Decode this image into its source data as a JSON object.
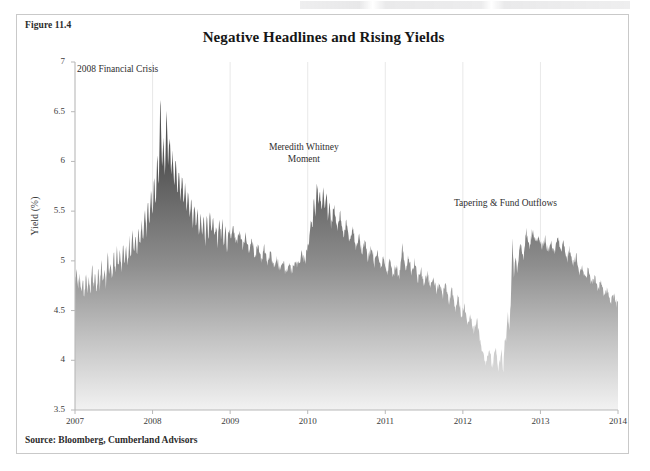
{
  "figure": {
    "label": "Figure 11.4",
    "title": "Negative Headlines and Rising Yields",
    "source": "Source: Bloomberg, Cumberland Advisors"
  },
  "colors": {
    "series_top": "#4a4a4a",
    "series_bottom": "#f2f2f2",
    "axis": "#b8b8b8",
    "gridline": "#e2e2e2",
    "text": "#2e2e2e",
    "border": "#c9c9c9"
  },
  "annotations": [
    {
      "id": "crisis-2008",
      "text": "2008 Financial Crisis",
      "x_value": 2007.55,
      "y_value": 6.93
    },
    {
      "id": "meredith-whitney",
      "text": "Meredith Whitney\nMoment",
      "x_value": 2009.95,
      "y_value": 6.15
    },
    {
      "id": "tapering",
      "text": "Tapering & Fund Outflows",
      "x_value": 2012.55,
      "y_value": 5.58
    }
  ],
  "chart_data": {
    "type": "area",
    "title": "Negative Headlines and Rising Yields",
    "xlabel": "",
    "ylabel": "Yield (%)",
    "xlim": [
      2007,
      2014
    ],
    "ylim": [
      3.5,
      7
    ],
    "x_ticks": [
      "2007",
      "2008",
      "2009",
      "2010",
      "2011",
      "2012",
      "2013",
      "2014"
    ],
    "y_ticks": [
      "3.5",
      "4",
      "4.5",
      "5",
      "5.5",
      "6",
      "6.5",
      "7"
    ],
    "grid": "vertical-faint",
    "legend": "none",
    "series_name": "Yield (%)",
    "fill": "gradient dark-to-light, top to baseline",
    "x": [
      2007.0,
      2007.02,
      2007.04,
      2007.06,
      2007.08,
      2007.1,
      2007.12,
      2007.14,
      2007.16,
      2007.18,
      2007.2,
      2007.22,
      2007.24,
      2007.26,
      2007.28,
      2007.3,
      2007.32,
      2007.34,
      2007.36,
      2007.38,
      2007.4,
      2007.42,
      2007.44,
      2007.46,
      2007.48,
      2007.5,
      2007.52,
      2007.54,
      2007.56,
      2007.58,
      2007.6,
      2007.62,
      2007.64,
      2007.66,
      2007.68,
      2007.7,
      2007.72,
      2007.74,
      2007.76,
      2007.78,
      2007.8,
      2007.82,
      2007.84,
      2007.86,
      2007.88,
      2007.9,
      2007.92,
      2007.94,
      2007.96,
      2007.98,
      2008.0,
      2008.02,
      2008.04,
      2008.06,
      2008.08,
      2008.1,
      2008.12,
      2008.14,
      2008.16,
      2008.18,
      2008.2,
      2008.22,
      2008.24,
      2008.26,
      2008.28,
      2008.3,
      2008.32,
      2008.34,
      2008.36,
      2008.38,
      2008.4,
      2008.42,
      2008.44,
      2008.46,
      2008.48,
      2008.5,
      2008.52,
      2008.54,
      2008.56,
      2008.58,
      2008.6,
      2008.62,
      2008.64,
      2008.66,
      2008.68,
      2008.7,
      2008.72,
      2008.74,
      2008.76,
      2008.78,
      2008.8,
      2008.82,
      2008.84,
      2008.86,
      2008.88,
      2008.9,
      2008.92,
      2008.94,
      2008.96,
      2008.98,
      2009.0,
      2009.04,
      2009.08,
      2009.12,
      2009.16,
      2009.2,
      2009.24,
      2009.28,
      2009.32,
      2009.36,
      2009.4,
      2009.44,
      2009.48,
      2009.52,
      2009.56,
      2009.6,
      2009.64,
      2009.68,
      2009.72,
      2009.76,
      2009.8,
      2009.84,
      2009.88,
      2009.92,
      2009.96,
      2010.0,
      2010.02,
      2010.04,
      2010.06,
      2010.08,
      2010.1,
      2010.12,
      2010.14,
      2010.16,
      2010.18,
      2010.2,
      2010.22,
      2010.24,
      2010.26,
      2010.28,
      2010.3,
      2010.34,
      2010.38,
      2010.42,
      2010.46,
      2010.5,
      2010.54,
      2010.58,
      2010.62,
      2010.66,
      2010.7,
      2010.74,
      2010.78,
      2010.82,
      2010.86,
      2010.9,
      2010.94,
      2010.98,
      2011.02,
      2011.06,
      2011.1,
      2011.14,
      2011.18,
      2011.22,
      2011.26,
      2011.3,
      2011.34,
      2011.38,
      2011.42,
      2011.46,
      2011.5,
      2011.54,
      2011.58,
      2011.62,
      2011.66,
      2011.7,
      2011.74,
      2011.78,
      2011.82,
      2011.86,
      2011.9,
      2011.94,
      2011.98,
      2012.02,
      2012.06,
      2012.1,
      2012.14,
      2012.18,
      2012.22,
      2012.26,
      2012.3,
      2012.34,
      2012.38,
      2012.42,
      2012.46,
      2012.5,
      2012.52,
      2012.54,
      2012.56,
      2012.58,
      2012.6,
      2012.62,
      2012.64,
      2012.66,
      2012.68,
      2012.7,
      2012.74,
      2012.78,
      2012.82,
      2012.86,
      2012.9,
      2012.94,
      2012.98,
      2013.02,
      2013.06,
      2013.1,
      2013.14,
      2013.18,
      2013.22,
      2013.26,
      2013.3,
      2013.34,
      2013.38,
      2013.42,
      2013.46,
      2013.5,
      2013.54,
      2013.58,
      2013.62,
      2013.66,
      2013.7,
      2013.74,
      2013.78,
      2013.82,
      2013.86,
      2013.9,
      2013.94,
      2013.98,
      2014.0
    ],
    "y": [
      4.76,
      4.92,
      4.7,
      4.86,
      4.66,
      4.82,
      4.62,
      4.9,
      4.68,
      4.84,
      4.64,
      4.96,
      4.72,
      4.88,
      4.66,
      4.94,
      4.7,
      5.02,
      4.78,
      4.92,
      4.72,
      5.1,
      4.84,
      5.0,
      4.8,
      5.06,
      4.86,
      5.14,
      4.9,
      5.08,
      4.88,
      5.18,
      4.96,
      5.12,
      4.92,
      5.22,
      5.02,
      5.3,
      5.08,
      5.26,
      5.04,
      5.34,
      5.12,
      5.42,
      5.2,
      5.5,
      5.26,
      5.64,
      5.34,
      5.72,
      5.4,
      5.86,
      5.52,
      6.1,
      5.7,
      6.72,
      5.9,
      6.2,
      5.84,
      6.55,
      5.96,
      6.24,
      5.88,
      6.08,
      5.76,
      6.0,
      5.68,
      5.92,
      5.6,
      5.86,
      5.54,
      5.78,
      5.46,
      5.7,
      5.4,
      5.62,
      5.34,
      5.58,
      5.28,
      5.52,
      5.24,
      5.48,
      5.2,
      5.44,
      5.18,
      5.46,
      5.22,
      5.5,
      5.26,
      5.42,
      5.2,
      5.38,
      5.16,
      5.44,
      5.22,
      5.4,
      5.14,
      5.32,
      5.1,
      5.28,
      5.22,
      5.34,
      5.16,
      5.3,
      5.12,
      5.26,
      5.08,
      5.2,
      5.04,
      5.16,
      5.0,
      5.12,
      4.96,
      5.06,
      4.92,
      5.02,
      4.88,
      4.98,
      4.86,
      4.96,
      4.88,
      5.0,
      4.94,
      5.08,
      4.98,
      5.12,
      5.2,
      5.42,
      5.3,
      5.64,
      5.44,
      5.82,
      5.52,
      5.68,
      5.46,
      5.74,
      5.5,
      5.7,
      5.42,
      5.62,
      5.36,
      5.54,
      5.3,
      5.46,
      5.24,
      5.4,
      5.18,
      5.32,
      5.12,
      5.26,
      5.06,
      5.2,
      5.0,
      5.14,
      4.96,
      5.08,
      4.92,
      5.04,
      4.88,
      5.0,
      4.84,
      4.96,
      4.82,
      5.12,
      4.92,
      5.06,
      4.86,
      4.98,
      4.8,
      4.92,
      4.76,
      4.88,
      4.72,
      4.84,
      4.68,
      4.8,
      4.64,
      4.76,
      4.58,
      4.7,
      4.52,
      4.62,
      4.44,
      4.54,
      4.36,
      4.46,
      4.28,
      4.4,
      4.22,
      4.06,
      3.96,
      4.12,
      3.92,
      4.14,
      3.9,
      4.1,
      3.88,
      4.22,
      4.18,
      4.46,
      4.3,
      4.62,
      5.22,
      4.8,
      5.06,
      4.88,
      5.18,
      5.02,
      5.28,
      5.14,
      5.3,
      5.18,
      5.26,
      5.12,
      5.22,
      5.08,
      5.2,
      5.06,
      5.24,
      5.1,
      5.18,
      5.0,
      5.12,
      4.94,
      5.04,
      4.88,
      4.96,
      4.82,
      4.9,
      4.76,
      4.84,
      4.7,
      4.78,
      4.64,
      4.72,
      4.58,
      4.66,
      4.54,
      4.6,
      4.48,
      4.54,
      4.42,
      4.48,
      4.38,
      4.44,
      4.32,
      4.3
    ]
  }
}
